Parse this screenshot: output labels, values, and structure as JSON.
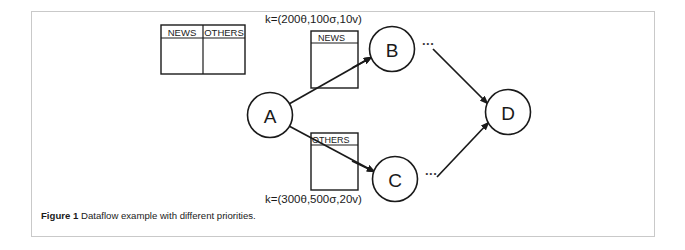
{
  "figure": {
    "caption_label": "Figure 1",
    "caption_text": "Dataflow example with different priorities.",
    "border_color": "#c9c9c9",
    "ink_color": "#1a1a1a"
  },
  "legend_table": {
    "name": "queue-legend-table",
    "columns": [
      "NEWS",
      "OTHERS"
    ],
    "rows": []
  },
  "nodes": [
    {
      "id": "A",
      "label": "A",
      "cx": 270,
      "cy": 115,
      "r": 22.5
    },
    {
      "id": "B",
      "label": "B",
      "cx": 392,
      "cy": 49,
      "r": 22.5
    },
    {
      "id": "C",
      "label": "C",
      "cx": 395,
      "cy": 179,
      "r": 22.5
    },
    {
      "id": "D",
      "label": "D",
      "cx": 508,
      "cy": 112,
      "r": 22.5
    }
  ],
  "queues": [
    {
      "id": "news-queue",
      "label": "NEWS",
      "x": 311,
      "y": 31,
      "width": 47,
      "height": 57
    },
    {
      "id": "others-queue",
      "label": "OTHERS",
      "x": 311,
      "y": 133,
      "width": 47,
      "height": 57
    }
  ],
  "edges": [
    {
      "id": "edge-a-b",
      "from": "A",
      "to": "B",
      "via": "news-queue"
    },
    {
      "id": "edge-a-c",
      "from": "A",
      "to": "C",
      "via": "others-queue"
    },
    {
      "id": "edge-b-d",
      "from": "B",
      "to": "D",
      "via": null
    },
    {
      "id": "edge-c-d",
      "from": "C",
      "to": "D",
      "via": null
    }
  ],
  "priority_labels": [
    {
      "id": "priority-news",
      "text": "k=(200θ,100σ,10v)",
      "x": 265,
      "y": 23,
      "for_edge": "edge-a-b"
    },
    {
      "id": "priority-others",
      "text": "k=(300θ,500σ,20v)",
      "x": 265,
      "y": 203,
      "for_edge": "edge-a-c"
    }
  ],
  "ellipses": [
    {
      "id": "ellipsis-after-b",
      "text": "...",
      "x": 422,
      "y": 45
    },
    {
      "id": "ellipsis-after-c",
      "text": "...",
      "x": 425,
      "y": 175
    }
  ]
}
